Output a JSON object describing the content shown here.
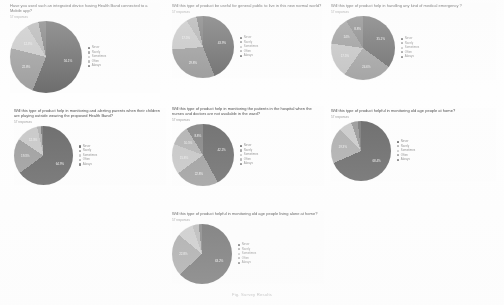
{
  "document": {
    "caption": "Fig. Survey Results",
    "legend_labels": [
      "Never",
      "Rarely",
      "Sometimes",
      "Often",
      "Always"
    ],
    "legend_colors": [
      "#6e6e6e",
      "#8a8a8a",
      "#a8a8a8",
      "#c2c2c2",
      "#555555"
    ]
  },
  "chart_data": [
    {
      "id": "chart-1",
      "type": "pie",
      "title": "Have you used such an integrated device having Health Band connected to a Mobile app?",
      "responses": "57 responses",
      "categories": [
        "Never",
        "Rarely",
        "Sometimes",
        "Often",
        "Always"
      ],
      "values": [
        56.1,
        22.8,
        12.3,
        5.3,
        3.5
      ],
      "labels": [
        "56.1%",
        "22.8%",
        "12.3%",
        "",
        ""
      ],
      "colors": [
        "#6e6e6e",
        "#9f9f9f",
        "#c9c9c9",
        "#b5b5b5",
        "#808080"
      ],
      "legend_position": "right"
    },
    {
      "id": "chart-2",
      "type": "pie",
      "title": "Will this type of product be useful for general public  to live in this new normal world?",
      "responses": "57 responses",
      "categories": [
        "Never",
        "Rarely",
        "Sometimes",
        "Often",
        "Always"
      ],
      "values": [
        43.9,
        29.8,
        17.5,
        5.3,
        3.5
      ],
      "labels": [
        "43.9%",
        "29.8%",
        "17.5%",
        "",
        ""
      ],
      "colors": [
        "#6e6e6e",
        "#9a9a9a",
        "#c6c6c6",
        "#b0b0b0",
        "#7a7a7a"
      ],
      "legend_position": "right"
    },
    {
      "id": "chart-3",
      "type": "pie",
      "title": "Will this type of product help in handling any kind of medical emergency ?",
      "responses": "57 responses",
      "categories": [
        "Never",
        "Rarely",
        "Sometimes",
        "Often",
        "Always"
      ],
      "values": [
        35.1,
        24.6,
        17.5,
        14.0,
        8.8
      ],
      "labels": [
        "35.1%",
        "24.6%",
        "17.5%",
        "14%",
        "8.8%"
      ],
      "colors": [
        "#707070",
        "#a2a2a2",
        "#c4c4c4",
        "#9a9a9a",
        "#858585"
      ],
      "legend_position": "right"
    },
    {
      "id": "chart-4",
      "type": "pie",
      "title": "Will this type of product help in monitoring and alerting parents when their children are playing outside wearing the proposed Health Band?",
      "responses": "57 responses",
      "categories": [
        "Never",
        "Rarely",
        "Sometimes",
        "Often",
        "Always"
      ],
      "values": [
        64.9,
        19.3,
        12.3,
        2.0,
        1.5
      ],
      "labels": [
        "64.9%",
        "19.3%",
        "12.3%",
        "",
        ""
      ],
      "colors": [
        "#6a6a6a",
        "#9e9e9e",
        "#c8c8c8",
        "#b2b2b2",
        "#7d7d7d"
      ],
      "legend_position": "right"
    },
    {
      "id": "chart-5",
      "type": "pie",
      "title": "Will this type of product help in monitoring the patients in the hospital when the nurses and doctors are not available in the ward?",
      "responses": "57 responses",
      "categories": [
        "Never",
        "Rarely",
        "Sometimes",
        "Often",
        "Always"
      ],
      "values": [
        42.1,
        22.8,
        15.8,
        10.5,
        8.8
      ],
      "labels": [
        "42.1%",
        "22.8%",
        "15.8%",
        "10.5%",
        "8.8%"
      ],
      "colors": [
        "#6f6f6f",
        "#a0a0a0",
        "#c7c7c7",
        "#b4b4b4",
        "#888888"
      ],
      "legend_position": "right"
    },
    {
      "id": "chart-6",
      "type": "pie",
      "title": "Will this type of product helpful in monitoring old age people at home?",
      "responses": "57 responses",
      "categories": [
        "Never",
        "Rarely",
        "Sometimes",
        "Often",
        "Always"
      ],
      "values": [
        68.4,
        19.3,
        7.0,
        3.5,
        1.8
      ],
      "labels": [
        "68.4%",
        "19.3%",
        "",
        "",
        ""
      ],
      "colors": [
        "#6c6c6c",
        "#b0b0b0",
        "#cbcbcb",
        "#9c9c9c",
        "#7f7f7f"
      ],
      "legend_position": "right"
    },
    {
      "id": "chart-7",
      "type": "pie",
      "title": "Will this type of product helpful in monitoring old age people living alone at home?",
      "responses": "57 responses",
      "categories": [
        "Never",
        "Rarely",
        "Sometimes",
        "Often",
        "Always"
      ],
      "values": [
        63.2,
        22.8,
        8.8,
        3.4,
        1.8
      ],
      "labels": [
        "63.2%",
        "22.8%",
        "",
        "",
        ""
      ],
      "colors": [
        "#6d6d6d",
        "#a6a6a6",
        "#c9c9c9",
        "#b6b6b6",
        "#818181"
      ],
      "legend_position": "right"
    }
  ]
}
